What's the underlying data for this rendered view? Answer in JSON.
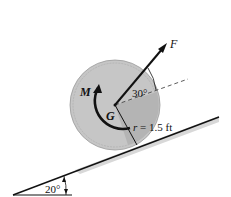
{
  "diagram": {
    "labels": {
      "force": "F",
      "moment": "M",
      "center": "G",
      "angle_force": "30°",
      "radius": "r = 1.5 ft",
      "incline_angle": "20°"
    },
    "values": {
      "radius_ft": 1.5,
      "force_angle_deg": 30,
      "incline_angle_deg": 20
    },
    "colors": {
      "disk_outer": "#c9c9c9",
      "disk_inner": "#b8b8b8",
      "line": "#111111"
    }
  }
}
